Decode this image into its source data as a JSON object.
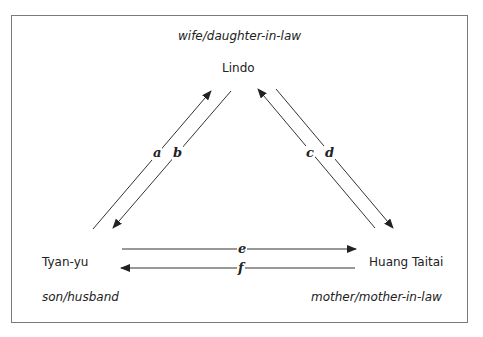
{
  "diagram": {
    "nodes": {
      "top": {
        "name": "Lindo",
        "role": "wife/daughter-in-law"
      },
      "left": {
        "name": "Tyan-yu",
        "role": "son/husband"
      },
      "right": {
        "name": "Huang Taitai",
        "role": "mother/mother-in-law"
      }
    },
    "edges": [
      {
        "label": "a",
        "from": "Tyan-yu",
        "to": "Lindo"
      },
      {
        "label": "b",
        "from": "Lindo",
        "to": "Tyan-yu"
      },
      {
        "label": "c",
        "from": "Huang Taitai",
        "to": "Lindo"
      },
      {
        "label": "d",
        "from": "Lindo",
        "to": "Huang Taitai"
      },
      {
        "label": "e",
        "from": "Tyan-yu",
        "to": "Huang Taitai"
      },
      {
        "label": "f",
        "from": "Huang Taitai",
        "to": "Tyan-yu"
      }
    ],
    "colors": {
      "line": "#333333",
      "border": "#7a7a7a"
    }
  }
}
